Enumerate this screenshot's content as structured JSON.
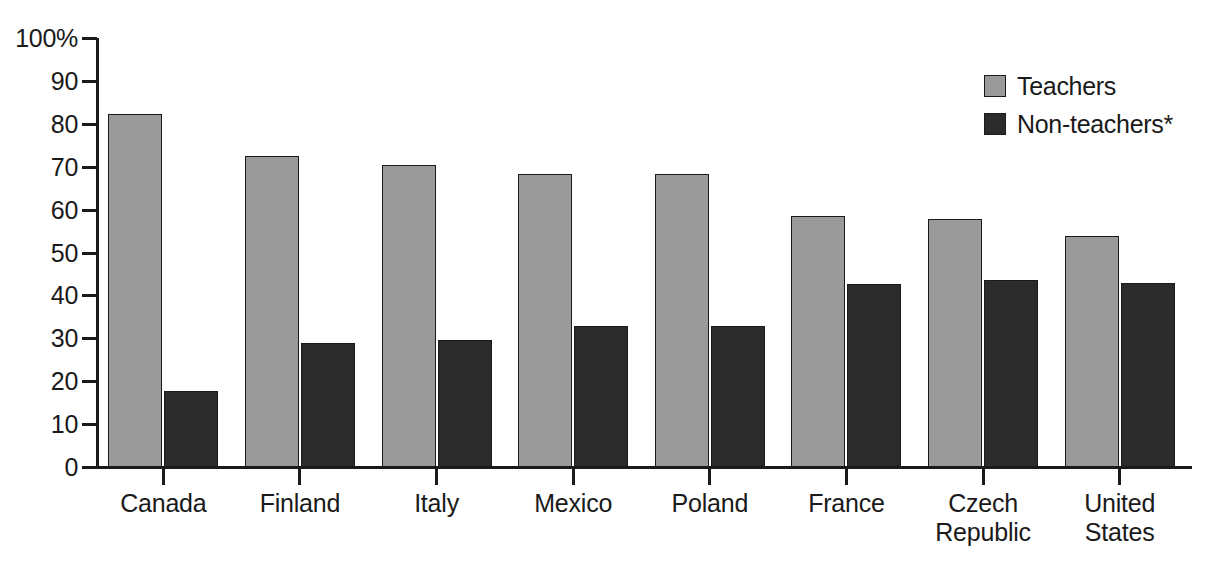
{
  "chart_data": {
    "type": "bar",
    "title": "",
    "subtitle": "",
    "xlabel": "",
    "ylabel": "",
    "ylim": [
      0,
      100
    ],
    "grid": false,
    "legend_position": "top-right",
    "y_ticks": [
      "100%",
      "90",
      "80",
      "70",
      "60",
      "50",
      "40",
      "30",
      "20",
      "10",
      "0"
    ],
    "y_tick_values": [
      100,
      90,
      80,
      70,
      60,
      50,
      40,
      30,
      20,
      10,
      0
    ],
    "categories": [
      "Canada",
      "Finland",
      "Italy",
      "Mexico",
      "Poland",
      "France",
      "Czech\nRepublic",
      "United\nStates"
    ],
    "series": [
      {
        "name": "Teachers",
        "color": "#9a9a9a",
        "values": [
          82.3,
          72.6,
          70.4,
          68.3,
          68.3,
          58.5,
          57.7,
          53.8
        ]
      },
      {
        "name": "Non-teachers*",
        "color": "#2b2b2b",
        "values": [
          17.8,
          28.8,
          29.7,
          32.8,
          32.8,
          42.7,
          43.6,
          42.8
        ]
      }
    ],
    "footnote_marker": "*"
  },
  "legend": {
    "items": [
      {
        "label": "Teachers",
        "swatch": "teachers"
      },
      {
        "label": "Non-teachers*",
        "swatch": "nonteachers"
      }
    ]
  },
  "axis": {
    "y_axis_name": "percent-axis",
    "x_axis_name": "country-axis"
  }
}
